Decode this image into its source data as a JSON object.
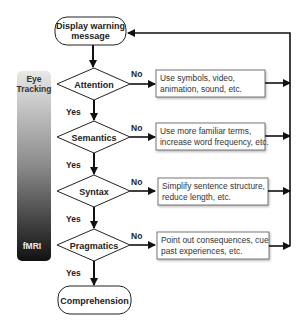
{
  "flowchart": {
    "start": {
      "label_line1": "Display warning",
      "label_line2": "message"
    },
    "end": {
      "label": "Comprehension"
    },
    "side_bar": {
      "top_label_line1": "Eye",
      "top_label_line2": "Tracking",
      "bottom_label": "fMRI",
      "gradient_top": "#e8e8e8",
      "gradient_bottom": "#111111"
    },
    "decisions": [
      {
        "label": "Attention",
        "no": "No",
        "yes": "Yes",
        "action_line1": "Use symbols, video,",
        "action_line2": "animation, sound, etc."
      },
      {
        "label": "Semantics",
        "no": "No",
        "yes": "Yes",
        "action_line1": "Use more familiar terms,",
        "action_line2": "increase word frequency, etc."
      },
      {
        "label": "Syntax",
        "no": "No",
        "yes": "Yes",
        "action_line1": "Simplify sentence structure,",
        "action_line2": "reduce length, etc."
      },
      {
        "label": "Pragmatics",
        "no": "No",
        "yes": "Yes",
        "action_line1": "Point out consequences, cue",
        "action_line2": "past experiences, etc."
      }
    ]
  }
}
